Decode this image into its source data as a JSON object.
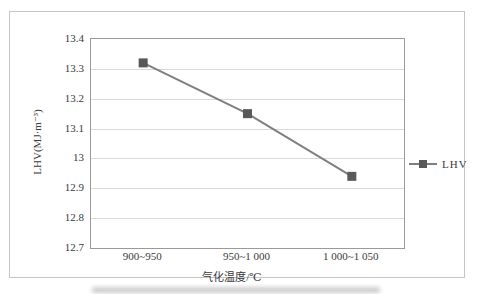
{
  "chart": {
    "y_axis_title": "LHV(MJ·m⁻³)",
    "x_axis_title": "气化温度/℃",
    "legend_label": "LHV"
  },
  "chart_data": {
    "type": "line",
    "categories": [
      "900~950",
      "950~1 000",
      "1 000~1 050"
    ],
    "series": [
      {
        "name": "LHV",
        "values": [
          13.32,
          13.15,
          12.94
        ]
      }
    ],
    "title": "",
    "xlabel": "气化温度/℃",
    "ylabel": "LHV(MJ·m⁻³)",
    "ylim": [
      12.7,
      13.4
    ],
    "ytick_step": 0.1,
    "ytick_labels": [
      "13.4",
      "13.3",
      "13.2",
      "13.1",
      "13",
      "12.9",
      "12.8",
      "12.7"
    ],
    "grid": true,
    "legend_position": "right-middle",
    "marker_shape": "square",
    "colors": {
      "line": "#7f7f7f",
      "marker": "#595959",
      "gridline": "#d9d9d9",
      "plot_border": "#9a9a9a",
      "chart_border": "#c6c6c6",
      "text": "#3a3a3a"
    }
  }
}
